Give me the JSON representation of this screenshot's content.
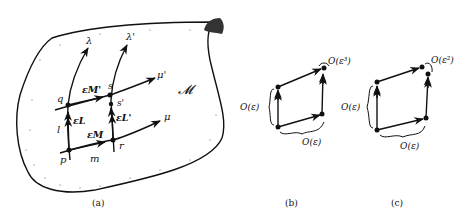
{
  "panels": {
    "a": {
      "caption": "(a)",
      "manifold_label": "𝓜",
      "points": {
        "p": "p",
        "q": "q",
        "r": "r",
        "s": "s",
        "s_prime": "s'"
      },
      "curves": {
        "lambda": "λ",
        "lambda_prime": "λ'",
        "mu": "μ",
        "mu_prime": "μ'",
        "l": "l",
        "m": "m"
      },
      "vectors": {
        "eL": "εL",
        "eM": "εM",
        "eL_prime": "εL'",
        "eM_prime": "εM'"
      }
    },
    "b": {
      "caption": "(b)",
      "gap_label": "O(ε³)",
      "side_label": "O(ε)",
      "bottom_label": "O(ε)"
    },
    "c": {
      "caption": "(c)",
      "gap_label": "O(ε²)",
      "side_label": "O(ε)",
      "bottom_label": "O(ε)"
    }
  },
  "colors": {
    "ink": "#111111",
    "paper": "#ffffff"
  }
}
